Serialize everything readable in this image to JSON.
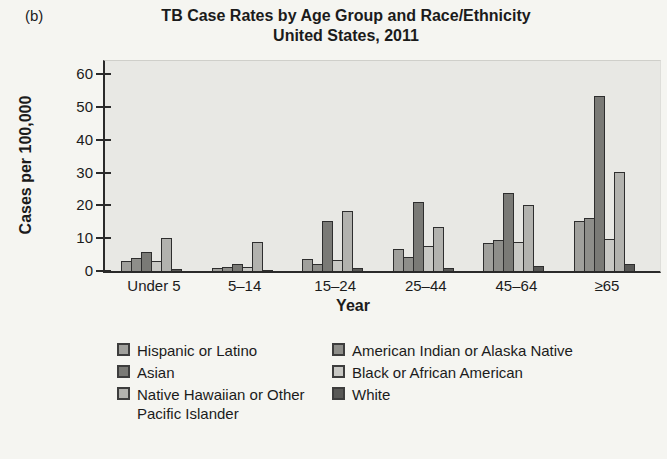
{
  "panel_label": "(b)",
  "title": "TB Case Rates by Age Group and Race/Ethnicity",
  "subtitle": "United States, 2011",
  "chart_data": {
    "type": "bar",
    "title": "TB Case Rates by Age Group and Race/Ethnicity United States, 2011",
    "xlabel": "Year",
    "ylabel": "Cases per 100,000",
    "ylim": [
      0,
      60
    ],
    "yticks": [
      0,
      10,
      20,
      30,
      40,
      50,
      60
    ],
    "grid": false,
    "legend_position": "bottom",
    "categories": [
      "Under 5",
      "5–14",
      "15–24",
      "25–44",
      "45–64",
      "≥65"
    ],
    "series": [
      {
        "name": "Hispanic or Latino",
        "color": "#a0a09c",
        "values": [
          3.0,
          0.9,
          3.7,
          6.6,
          8.4,
          15.2
        ]
      },
      {
        "name": "American Indian or Alaska Native",
        "color": "#8e8e8a",
        "values": [
          4.0,
          1.1,
          2.0,
          4.4,
          9.3,
          16.0
        ]
      },
      {
        "name": "Asian",
        "color": "#7a7a76",
        "values": [
          5.7,
          2.2,
          15.2,
          21.0,
          23.8,
          53.3
        ]
      },
      {
        "name": "Black or African American",
        "color": "#c8c8c4",
        "values": [
          3.0,
          1.3,
          3.4,
          7.6,
          8.8,
          9.7
        ]
      },
      {
        "name": "Native Hawaiian or Other Pacific Islander",
        "color": "#b2b2ae",
        "values": [
          10.2,
          8.9,
          18.3,
          13.5,
          20.0,
          30.2
        ]
      },
      {
        "name": "White",
        "color": "#585856",
        "values": [
          0.6,
          0.3,
          0.8,
          0.8,
          1.4,
          2.0
        ]
      }
    ],
    "legend_columns": [
      [
        0,
        2,
        4
      ],
      [
        1,
        3,
        5
      ]
    ]
  },
  "colors": {
    "page_bg": "#f5f5f1",
    "plot_bg": "#e8e8e4",
    "axis": "#2a2a2a",
    "bar_border": "#2e2e2e"
  }
}
